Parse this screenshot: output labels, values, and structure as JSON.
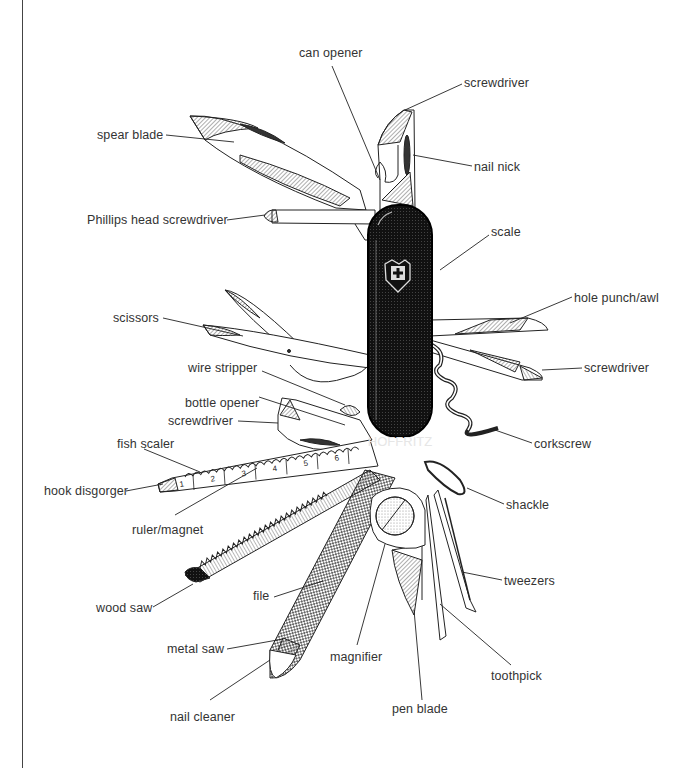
{
  "diagram": {
    "brand_mark": "HOFFRITZ",
    "ruler_ticks": [
      "1",
      "2",
      "3",
      "4",
      "5",
      "6"
    ],
    "labels": [
      {
        "id": "can-opener",
        "text": "can opener",
        "x": 299,
        "y": 46,
        "lx1": 332,
        "ly1": 66,
        "lx2": 380,
        "ly2": 180
      },
      {
        "id": "screwdriver-top",
        "text": "screwdriver",
        "x": 464,
        "y": 76,
        "lx1": 462,
        "ly1": 84,
        "lx2": 405,
        "ly2": 110
      },
      {
        "id": "spear-blade",
        "text": "spear blade",
        "x": 97,
        "y": 128,
        "lx1": 166,
        "ly1": 135,
        "lx2": 234,
        "ly2": 142
      },
      {
        "id": "nail-nick",
        "text": "nail nick",
        "x": 474,
        "y": 160,
        "lx1": 472,
        "ly1": 166,
        "lx2": 413,
        "ly2": 155
      },
      {
        "id": "phillips-screwdriver",
        "text": "Phillips head screwdriver",
        "x": 87,
        "y": 213,
        "lx1": 227,
        "ly1": 220,
        "lx2": 265,
        "ly2": 215
      },
      {
        "id": "scale",
        "text": "scale",
        "x": 491,
        "y": 225,
        "lx1": 489,
        "ly1": 235,
        "lx2": 440,
        "ly2": 270
      },
      {
        "id": "hole-punch-awl",
        "text": "hole punch/awl",
        "x": 574,
        "y": 291,
        "lx1": 572,
        "ly1": 297,
        "lx2": 510,
        "ly2": 323
      },
      {
        "id": "scissors",
        "text": "scissors",
        "x": 113,
        "y": 311,
        "lx1": 163,
        "ly1": 318,
        "lx2": 243,
        "ly2": 336
      },
      {
        "id": "screwdriver-right",
        "text": "screwdriver",
        "x": 584,
        "y": 361,
        "lx1": 582,
        "ly1": 368,
        "lx2": 542,
        "ly2": 370
      },
      {
        "id": "wire-stripper",
        "text": "wire stripper",
        "x": 188,
        "y": 361,
        "lx1": 262,
        "ly1": 371,
        "lx2": 345,
        "ly2": 405
      },
      {
        "id": "bottle-opener",
        "text": "bottle opener",
        "x": 185,
        "y": 396,
        "lx1": 259,
        "ly1": 397,
        "lx2": 345,
        "ly2": 425
      },
      {
        "id": "screwdriver-left",
        "text": "screwdriver",
        "x": 168,
        "y": 414,
        "lx1": 238,
        "ly1": 421,
        "lx2": 278,
        "ly2": 423
      },
      {
        "id": "corkscrew",
        "text": "corkscrew",
        "x": 534,
        "y": 437,
        "lx1": 532,
        "ly1": 443,
        "lx2": 495,
        "ly2": 430
      },
      {
        "id": "fish-scaler",
        "text": "fish scaler",
        "x": 117,
        "y": 437,
        "lx1": 144,
        "ly1": 449,
        "lx2": 200,
        "ly2": 472
      },
      {
        "id": "hook-disgorger",
        "text": "hook disgorger",
        "x": 44,
        "y": 484,
        "lx1": 126,
        "ly1": 491,
        "lx2": 163,
        "ly2": 484
      },
      {
        "id": "shackle",
        "text": "shackle",
        "x": 506,
        "y": 498,
        "lx1": 504,
        "ly1": 504,
        "lx2": 467,
        "ly2": 488
      },
      {
        "id": "ruler-magnet",
        "text": "ruler/magnet",
        "x": 132,
        "y": 523,
        "lx1": 175,
        "ly1": 515,
        "lx2": 257,
        "ly2": 468
      },
      {
        "id": "tweezers",
        "text": "tweezers",
        "x": 504,
        "y": 574,
        "lx1": 502,
        "ly1": 580,
        "lx2": 462,
        "ly2": 572
      },
      {
        "id": "wood-saw",
        "text": "wood saw",
        "x": 96,
        "y": 601,
        "lx1": 153,
        "ly1": 607,
        "lx2": 193,
        "ly2": 584
      },
      {
        "id": "file",
        "text": "file",
        "x": 253,
        "y": 589,
        "lx1": 274,
        "ly1": 597,
        "lx2": 323,
        "ly2": 581
      },
      {
        "id": "metal-saw",
        "text": "metal saw",
        "x": 167,
        "y": 642,
        "lx1": 227,
        "ly1": 649,
        "lx2": 283,
        "ly2": 639
      },
      {
        "id": "magnifier",
        "text": "magnifier",
        "x": 330,
        "y": 650,
        "lx1": 357,
        "ly1": 645,
        "lx2": 385,
        "ly2": 544
      },
      {
        "id": "toothpick",
        "text": "toothpick",
        "x": 491,
        "y": 669,
        "lx1": 511,
        "ly1": 665,
        "lx2": 440,
        "ly2": 604
      },
      {
        "id": "nail-cleaner",
        "text": "nail cleaner",
        "x": 170,
        "y": 710,
        "lx1": 210,
        "ly1": 700,
        "lx2": 270,
        "ly2": 660
      },
      {
        "id": "pen-blade",
        "text": "pen blade",
        "x": 392,
        "y": 702,
        "lx1": 422,
        "ly1": 700,
        "lx2": 414,
        "ly2": 610
      }
    ]
  }
}
